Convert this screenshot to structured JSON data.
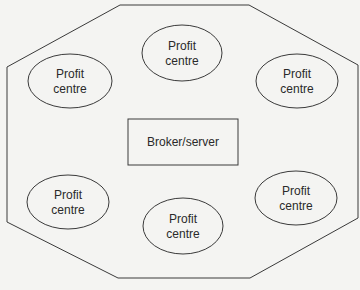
{
  "diagram": {
    "type": "network",
    "colors": {
      "background": "#f4f4f2",
      "stroke": "#3a3a3a",
      "text": "#2a2a2a"
    },
    "boundary": {
      "shape": "octagon"
    },
    "center_node": {
      "label": "Broker/server",
      "shape": "rectangle"
    },
    "nodes": [
      {
        "line1": "Profit",
        "line2": "centre",
        "position": "top-left"
      },
      {
        "line1": "Profit",
        "line2": "centre",
        "position": "top-center"
      },
      {
        "line1": "Profit",
        "line2": "centre",
        "position": "top-right"
      },
      {
        "line1": "Profit",
        "line2": "centre",
        "position": "bottom-left"
      },
      {
        "line1": "Profit",
        "line2": "centre",
        "position": "bottom-center"
      },
      {
        "line1": "Profit",
        "line2": "centre",
        "position": "bottom-right"
      }
    ]
  }
}
